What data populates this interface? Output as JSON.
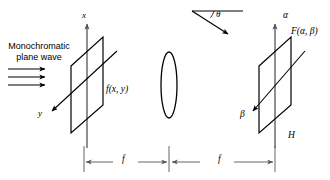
{
  "figure": {
    "kind": "optical-fourier-transform-setup",
    "width": 330,
    "height": 180,
    "background_color": "#ffffff",
    "line_color": "#000000",
    "axis_color": "#555555",
    "dimension_color": "#555555"
  },
  "labels": {
    "source_text": "Monochromatic\nplane wave",
    "source_line1": "Monochromatic",
    "source_line2": "plane wave",
    "x_axis": "x",
    "y_axis": "y",
    "input_function": "f(x, y)",
    "theta": "θ",
    "alpha_axis": "α",
    "beta_axis": "β",
    "output_function": "F(α, β)",
    "output_plane_name": "H",
    "focal_length_left": "f",
    "focal_length_right": "f"
  },
  "elements": {
    "input_plane": {
      "name": "input-plane",
      "corners": [
        [
          71,
          37
        ],
        [
          103,
          37
        ],
        [
          103,
          133
        ],
        [
          71,
          133
        ]
      ],
      "skew": "parallelogram"
    },
    "lens": {
      "name": "lens",
      "center_x": 169,
      "center_y": 85,
      "rx": 8,
      "ry": 33
    },
    "output_plane": {
      "name": "output-plane",
      "corners": [
        [
          259,
          37
        ],
        [
          291,
          37
        ],
        [
          291,
          133
        ],
        [
          259,
          133
        ]
      ],
      "skew": "parallelogram"
    },
    "wave_arrows": {
      "name": "plane-wave-arrows",
      "count": 3,
      "x_start": 8,
      "x_end": 48,
      "ys": [
        69,
        77,
        85
      ]
    },
    "dimensions": [
      {
        "name": "focal-length-left",
        "x1": 84,
        "x2": 169,
        "y": 162,
        "label": "f"
      },
      {
        "name": "focal-length-right",
        "x1": 169,
        "x2": 275,
        "y": 162,
        "label": "f"
      }
    ],
    "angle_marker": {
      "name": "diffraction-angle-marker",
      "vertex": [
        192,
        11
      ],
      "horizontal_end": [
        243,
        11
      ],
      "ray_end": [
        230,
        35
      ]
    }
  }
}
